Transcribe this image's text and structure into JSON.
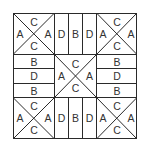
{
  "diagram": {
    "type": "quilt-block-pattern",
    "grid": "3x3",
    "line_color": "#2a2a2a",
    "text_color": "#333333",
    "cells": {
      "top_left": {
        "kind": "x-square",
        "top": "C",
        "left": "A",
        "right": "A",
        "bottom": "C"
      },
      "top_center": {
        "kind": "vertical-stripes",
        "labels": [
          "D",
          "B",
          "D"
        ]
      },
      "top_right": {
        "kind": "x-square",
        "top": "C",
        "left": "A",
        "right": "A",
        "bottom": "C"
      },
      "middle_left": {
        "kind": "horizontal-stripes",
        "labels": [
          "B",
          "D",
          "B"
        ]
      },
      "center": {
        "kind": "x-square",
        "top": "C",
        "left": "A",
        "right": "A",
        "bottom": "C"
      },
      "middle_right": {
        "kind": "horizontal-stripes",
        "labels": [
          "B",
          "D",
          "B"
        ]
      },
      "bottom_left": {
        "kind": "x-square",
        "top": "C",
        "left": "A",
        "right": "A",
        "bottom": "C"
      },
      "bottom_center": {
        "kind": "vertical-stripes",
        "labels": [
          "D",
          "B",
          "D"
        ]
      },
      "bottom_right": {
        "kind": "x-square",
        "top": "C",
        "left": "A",
        "right": "A",
        "bottom": "C"
      }
    }
  }
}
